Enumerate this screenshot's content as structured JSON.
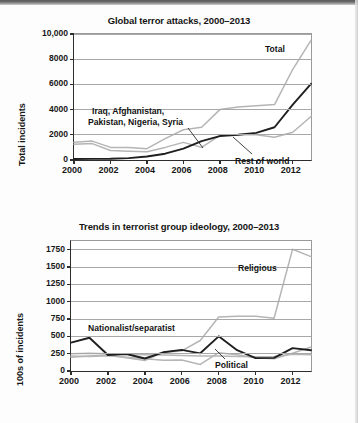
{
  "figure": {
    "charts": [
      {
        "id": "global-terror-attacks",
        "title": "Global terror attacks, 2000–2013",
        "ylabel": "Total incidents",
        "yticks": [
          "0",
          "2000",
          "4000",
          "6000",
          "8000",
          "10,000"
        ],
        "xticks": [
          "2000",
          "2002",
          "2004",
          "2006",
          "2008",
          "2010",
          "2012"
        ],
        "annotations": {
          "total": "Total",
          "hotspots": "Iraq, Afghanistan,\nPakistan, Nigeria, Syria",
          "hotspots_line1": "Iraq, Afghanistan,",
          "hotspots_line2": "Pakistan, Nigeria, Syria",
          "rest": "Rest of world"
        }
      },
      {
        "id": "terrorist-group-ideology",
        "title": "Trends in terrorist group ideology, 2000–2013",
        "ylabel": "100s of incidents",
        "yticks": [
          "0",
          "250",
          "500",
          "750",
          "1000",
          "1250",
          "1500",
          "1750"
        ],
        "xticks": [
          "2000",
          "2002",
          "2004",
          "2006",
          "2008",
          "2010",
          "2012"
        ],
        "annotations": {
          "religious": "Religious",
          "nationalist": "Nationalist/separatist",
          "political": "Political"
        }
      }
    ]
  },
  "colors": {
    "dark_series": "#1f1f1f",
    "light_series": "#b5b5b5",
    "axis": "#2d2d2d",
    "grid": "#a8a8a8",
    "background": "#ffffff"
  },
  "chart_data": [
    {
      "type": "line",
      "title": "Global terror attacks, 2000–2013",
      "xlabel": "",
      "ylabel": "Total incidents",
      "x": [
        2000,
        2001,
        2002,
        2003,
        2004,
        2005,
        2006,
        2007,
        2008,
        2009,
        2010,
        2011,
        2012,
        2013
      ],
      "xlim": [
        2000,
        2013
      ],
      "ylim": [
        0,
        10000
      ],
      "yticks": [
        0,
        2000,
        4000,
        6000,
        8000,
        10000
      ],
      "xticks": [
        2000,
        2002,
        2004,
        2006,
        2008,
        2010,
        2012
      ],
      "grid": true,
      "legend": "inline annotations",
      "series": [
        {
          "name": "Total",
          "color": "#b5b5b5",
          "values": [
            1400,
            1500,
            1000,
            1000,
            900,
            1700,
            2400,
            2600,
            4000,
            4200,
            4300,
            4400,
            7200,
            9500
          ]
        },
        {
          "name": "Iraq, Afghanistan, Pakistan, Nigeria, Syria",
          "color": "#1f1f1f",
          "values": [
            80,
            90,
            100,
            150,
            280,
            500,
            900,
            1500,
            1900,
            2000,
            2150,
            2600,
            4400,
            6050
          ]
        },
        {
          "name": "Rest of world",
          "color": "#b5b5b5",
          "values": [
            1250,
            1300,
            750,
            700,
            650,
            1000,
            1400,
            1000,
            1950,
            2000,
            2000,
            1800,
            2200,
            3450
          ]
        }
      ]
    },
    {
      "type": "line",
      "title": "Trends in terrorist group ideology, 2000–2013",
      "xlabel": "",
      "ylabel": "100s of incidents",
      "x": [
        2000,
        2001,
        2002,
        2003,
        2004,
        2005,
        2006,
        2007,
        2008,
        2009,
        2010,
        2011,
        2012,
        2013
      ],
      "xlim": [
        2000,
        2013
      ],
      "ylim": [
        0,
        1875
      ],
      "yticks": [
        0,
        250,
        500,
        750,
        1000,
        1250,
        1500,
        1750
      ],
      "xticks": [
        2000,
        2002,
        2004,
        2006,
        2008,
        2010,
        2012
      ],
      "grid": true,
      "legend": "inline annotations",
      "series": [
        {
          "name": "Religious",
          "color": "#b5b5b5",
          "values": [
            200,
            215,
            230,
            190,
            150,
            270,
            290,
            440,
            780,
            790,
            790,
            760,
            1755,
            1650
          ]
        },
        {
          "name": "Nationalist/separatist",
          "color": "#1f1f1f",
          "values": [
            410,
            480,
            230,
            245,
            180,
            270,
            305,
            255,
            500,
            300,
            185,
            190,
            330,
            300
          ]
        },
        {
          "name": "Political",
          "color": "#b5b5b5",
          "values": [
            250,
            255,
            250,
            240,
            235,
            230,
            225,
            215,
            215,
            210,
            205,
            210,
            240,
            235
          ]
        },
        {
          "name": "Other",
          "color": "#b5b5b5",
          "values": [
            215,
            210,
            220,
            200,
            175,
            155,
            160,
            95,
            265,
            235,
            190,
            175,
            255,
            345
          ]
        }
      ]
    }
  ]
}
